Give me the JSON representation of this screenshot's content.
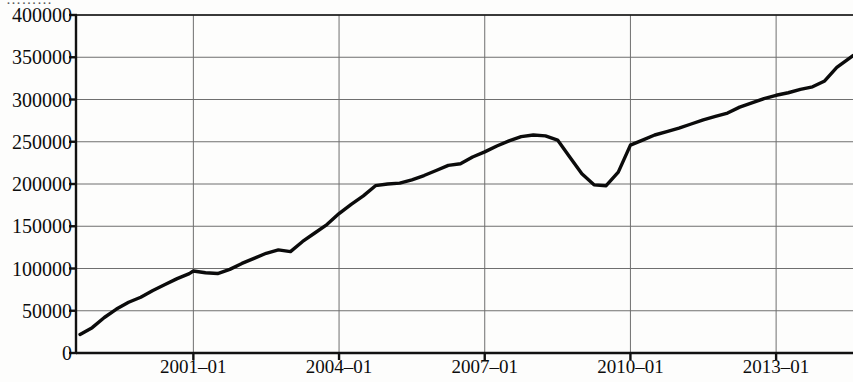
{
  "figure": {
    "clipped_header_text": "………",
    "background_color": "#fdfdfc",
    "line_color": "#0b0b0b",
    "grid_color": "#6f6f6f",
    "axis_color": "#111111"
  },
  "chart_data": {
    "type": "line",
    "title": "",
    "subtitle": "",
    "xlabel": "",
    "ylabel": "",
    "xlim": [
      "1998-08",
      "2014-08"
    ],
    "ylim": [
      0,
      400000
    ],
    "grid": true,
    "legend": null,
    "y_ticks": [
      0,
      50000,
      100000,
      150000,
      200000,
      250000,
      300000,
      350000,
      400000
    ],
    "y_tick_labels": [
      "0",
      "50000",
      "100000",
      "150000",
      "200000",
      "250000",
      "300000",
      "350000",
      "400000"
    ],
    "x_ticks": [
      "2001-01",
      "2004-01",
      "2007-01",
      "2010-01",
      "2013-01"
    ],
    "x_tick_labels": [
      "2001–01",
      "2004–01",
      "2007–01",
      "2010–01",
      "2013–01"
    ],
    "series": [
      {
        "name": "value",
        "x": [
          "1998-09",
          "1998-12",
          "1999-03",
          "1999-06",
          "1999-09",
          "1999-12",
          "2000-03",
          "2000-06",
          "2000-09",
          "2000-12",
          "2001-01",
          "2001-04",
          "2001-07",
          "2001-10",
          "2002-01",
          "2002-04",
          "2002-07",
          "2002-10",
          "2003-01",
          "2003-04",
          "2003-07",
          "2003-10",
          "2004-01",
          "2004-04",
          "2004-07",
          "2004-10",
          "2005-01",
          "2005-04",
          "2005-07",
          "2005-10",
          "2006-01",
          "2006-04",
          "2006-07",
          "2006-10",
          "2007-01",
          "2007-04",
          "2007-07",
          "2007-10",
          "2008-01",
          "2008-04",
          "2008-07",
          "2008-10",
          "2009-01",
          "2009-04",
          "2009-07",
          "2009-10",
          "2010-01",
          "2010-04",
          "2010-07",
          "2010-10",
          "2011-01",
          "2011-04",
          "2011-07",
          "2011-10",
          "2012-01",
          "2012-04",
          "2012-07",
          "2012-10",
          "2013-01",
          "2013-04",
          "2013-07",
          "2013-10",
          "2014-01",
          "2014-04",
          "2014-08"
        ],
        "y": [
          22000,
          30000,
          42000,
          52000,
          60000,
          66000,
          74000,
          81000,
          88000,
          94000,
          97000,
          95000,
          94000,
          99000,
          106000,
          112000,
          118000,
          122000,
          120000,
          132000,
          142000,
          152000,
          165000,
          176000,
          186000,
          198000,
          200000,
          201000,
          205000,
          210000,
          216000,
          222000,
          224000,
          232000,
          238000,
          245000,
          251000,
          256000,
          258000,
          257000,
          252000,
          232000,
          212000,
          199000,
          198000,
          214000,
          246000,
          252000,
          258000,
          262000,
          266000,
          271000,
          276000,
          280000,
          284000,
          291000,
          296000,
          301000,
          305000,
          308000,
          312000,
          315000,
          322000,
          338000,
          352000
        ]
      }
    ],
    "annotations": [
      {
        "label": "pre-crisis peak",
        "x": "2008-01",
        "y": 258000
      },
      {
        "label": "crisis trough",
        "x": "2009-07",
        "y": 198000
      }
    ]
  }
}
